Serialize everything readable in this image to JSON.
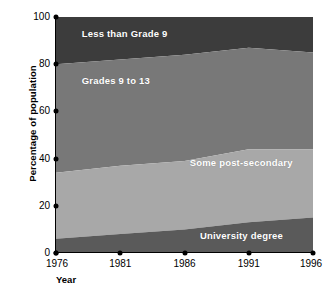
{
  "chart_data": {
    "type": "area",
    "title": "",
    "subtitle": "",
    "xlabel": "Year",
    "ylabel": "Percentage of population",
    "x": [
      1976,
      1981,
      1986,
      1991,
      1996
    ],
    "xtick_labels": [
      "1976",
      "1981",
      "1986",
      "1991",
      "1996"
    ],
    "ytick_labels": [
      "0",
      "20",
      "40",
      "60",
      "80",
      "100"
    ],
    "yticks": [
      0,
      20,
      40,
      60,
      80,
      100
    ],
    "xlim": [
      1976,
      1996
    ],
    "ylim": [
      0,
      100
    ],
    "grid": false,
    "legend_position": "inline-annotations",
    "stacked": true,
    "stack_order": "bottom-to-top",
    "series": [
      {
        "name": "University degree",
        "color": "#5a5a5a",
        "values": [
          6,
          8,
          10,
          13,
          15
        ]
      },
      {
        "name": "Some post-secondary",
        "color": "#a8a8a8",
        "values": [
          28,
          29,
          29,
          31,
          29
        ]
      },
      {
        "name": "Grades 9 to 13",
        "color": "#787878",
        "values": [
          46,
          45,
          45,
          43,
          41
        ]
      },
      {
        "name": "Less than Grade 9",
        "color": "#3c3c3c",
        "values": [
          20,
          18,
          16,
          13,
          15
        ]
      }
    ],
    "cumulative_tops": {
      "University degree": [
        6,
        8,
        10,
        13,
        15
      ],
      "Some post-secondary": [
        34,
        37,
        39,
        44,
        44
      ],
      "Grades 9 to 13": [
        80,
        82,
        84,
        87,
        85
      ],
      "Less than Grade 9": [
        100,
        100,
        100,
        100,
        100
      ]
    },
    "annotations": [
      {
        "text": "Less than Grade 9",
        "x_frac": 0.1,
        "y_pct": 93
      },
      {
        "text": "Grades 9 to 13",
        "x_frac": 0.1,
        "y_pct": 73
      },
      {
        "text": "Some post-secondary",
        "x_frac": 0.52,
        "y_pct": 38
      },
      {
        "text": "University degree",
        "x_frac": 0.56,
        "y_pct": 7
      }
    ]
  },
  "colors": {
    "background": "#ffffff",
    "axis": "#000000",
    "text": "#000000",
    "label_text": "#ffffff",
    "less_than_grade_9": "#3c3c3c",
    "grades_9_to_13": "#787878",
    "some_post_secondary": "#a8a8a8",
    "university_degree": "#5a5a5a"
  }
}
